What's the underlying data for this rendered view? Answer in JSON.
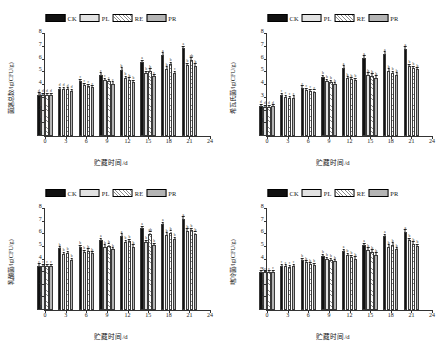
{
  "figure": {
    "legend": [
      {
        "key": "ck",
        "label": "CK",
        "fill": "solid-black",
        "color": "#111111"
      },
      {
        "key": "pl",
        "label": "PL",
        "fill": "dotted-light-gray",
        "color": "#e2e2e2"
      },
      {
        "key": "re",
        "label": "RE",
        "fill": "diagonal-hatch-white",
        "color": "#ffffff"
      },
      {
        "key": "pr",
        "label": "PR",
        "fill": "solid-gray",
        "color": "#b4b4b4"
      }
    ],
    "xlabel": "贮藏时间/d",
    "xticks": [
      "0",
      "3",
      "6",
      "9",
      "12",
      "15",
      "18",
      "21",
      "24"
    ],
    "yticks": [
      "0",
      "1",
      "2",
      "3",
      "4",
      "5",
      "6",
      "7",
      "8"
    ]
  },
  "chart_data": [
    {
      "type": "bar",
      "panel": "top-left",
      "title": "",
      "xlabel": "贮藏时间/d",
      "ylabel": "菌落总数/lg(CFU/g)",
      "categories": [
        "0",
        "3",
        "6",
        "9",
        "12",
        "15",
        "18",
        "21"
      ],
      "xlim": [
        0,
        24
      ],
      "ylim": [
        0,
        8
      ],
      "xticks": [
        "0",
        "3",
        "6",
        "9",
        "12",
        "15",
        "18",
        "21",
        "24"
      ],
      "yticks": [
        "0",
        "1",
        "2",
        "3",
        "4",
        "5",
        "6",
        "7",
        "8"
      ],
      "grid": false,
      "legend_position": "top-center",
      "series": [
        {
          "name": "CK",
          "values": [
            3.25,
            3.7,
            4.3,
            4.8,
            5.2,
            5.78,
            6.35,
            6.88
          ],
          "errors": [
            0.1,
            0.09,
            0.1,
            0.11,
            0.12,
            0.12,
            0.13,
            0.13
          ],
          "labels": [
            "d",
            "d",
            "c",
            "c",
            "b",
            "a",
            "a",
            "a"
          ]
        },
        {
          "name": "PL",
          "values": [
            3.22,
            3.68,
            4.0,
            4.38,
            4.55,
            4.92,
            5.28,
            5.55
          ],
          "errors": [
            0.09,
            0.09,
            0.1,
            0.1,
            0.11,
            0.11,
            0.12,
            0.12
          ],
          "labels": [
            "d",
            "d",
            "c",
            "c",
            "b",
            "b",
            "b",
            "b"
          ]
        },
        {
          "name": "RE",
          "values": [
            3.24,
            3.66,
            3.92,
            4.28,
            4.42,
            5.12,
            5.62,
            5.98
          ],
          "errors": [
            0.09,
            0.09,
            0.09,
            0.1,
            0.1,
            0.11,
            0.12,
            0.12
          ],
          "labels": [
            "d",
            "d",
            "c",
            "c",
            "b",
            "b",
            "b",
            "ab"
          ]
        },
        {
          "name": "PR",
          "values": [
            3.23,
            3.55,
            3.82,
            4.1,
            4.25,
            4.68,
            4.95,
            5.5
          ],
          "errors": [
            0.09,
            0.08,
            0.09,
            0.1,
            0.1,
            0.1,
            0.11,
            0.12
          ],
          "labels": [
            "d",
            "d",
            "c",
            "c",
            "b",
            "c",
            "c",
            "b"
          ]
        }
      ]
    },
    {
      "type": "bar",
      "panel": "top-right",
      "title": "",
      "xlabel": "贮藏时间/d",
      "ylabel": "希瓦氏菌/lg(CFU/g)",
      "categories": [
        "0",
        "3",
        "6",
        "9",
        "12",
        "15",
        "18",
        "21"
      ],
      "xlim": [
        0,
        24
      ],
      "ylim": [
        0,
        8
      ],
      "xticks": [
        "0",
        "3",
        "6",
        "9",
        "12",
        "15",
        "18",
        "21",
        "24"
      ],
      "yticks": [
        "0",
        "1",
        "2",
        "3",
        "4",
        "5",
        "6",
        "7",
        "8"
      ],
      "grid": false,
      "legend_position": "top-center",
      "series": [
        {
          "name": "CK",
          "values": [
            2.35,
            3.22,
            3.8,
            4.62,
            5.35,
            6.12,
            6.45,
            6.82
          ],
          "errors": [
            0.09,
            0.09,
            0.1,
            0.11,
            0.12,
            0.12,
            0.13,
            0.13
          ],
          "labels": [
            "d",
            "c",
            "c",
            "b",
            "a",
            "a",
            "a",
            "a"
          ]
        },
        {
          "name": "PL",
          "values": [
            2.28,
            3.05,
            3.62,
            4.3,
            4.52,
            4.82,
            5.12,
            5.48
          ],
          "errors": [
            0.08,
            0.09,
            0.09,
            0.1,
            0.1,
            0.11,
            0.11,
            0.12
          ],
          "labels": [
            "d",
            "c",
            "c",
            "b",
            "b",
            "b",
            "b",
            "b"
          ]
        },
        {
          "name": "RE",
          "values": [
            2.3,
            3.0,
            3.55,
            4.22,
            4.45,
            4.72,
            4.92,
            5.32
          ],
          "errors": [
            0.08,
            0.09,
            0.09,
            0.1,
            0.1,
            0.11,
            0.11,
            0.12
          ],
          "labels": [
            "d",
            "c",
            "c",
            "b",
            "b",
            "b",
            "b",
            "b"
          ]
        },
        {
          "name": "PR",
          "values": [
            2.32,
            3.02,
            3.48,
            4.05,
            4.38,
            4.58,
            4.82,
            5.22
          ],
          "errors": [
            0.08,
            0.09,
            0.09,
            0.1,
            0.1,
            0.1,
            0.11,
            0.11
          ],
          "labels": [
            "d",
            "c",
            "c",
            "b",
            "b",
            "b",
            "b",
            "b"
          ]
        }
      ]
    },
    {
      "type": "bar",
      "panel": "bottom-left",
      "title": "",
      "xlabel": "贮藏时间/d",
      "ylabel": "乳酸菌/lg(CFU/g)",
      "categories": [
        "0",
        "3",
        "6",
        "9",
        "12",
        "15",
        "18",
        "21"
      ],
      "xlim": [
        0,
        24
      ],
      "ylim": [
        0,
        8
      ],
      "xticks": [
        "0",
        "3",
        "6",
        "9",
        "12",
        "15",
        "18",
        "21",
        "24"
      ],
      "yticks": [
        "0",
        "1",
        "2",
        "3",
        "4",
        "5",
        "6",
        "7",
        "8"
      ],
      "grid": false,
      "legend_position": "top-center",
      "series": [
        {
          "name": "CK",
          "values": [
            3.52,
            4.88,
            5.0,
            5.52,
            5.88,
            6.48,
            6.8,
            7.2
          ],
          "errors": [
            0.09,
            0.11,
            0.11,
            0.12,
            0.12,
            0.13,
            0.13,
            0.14
          ],
          "labels": [
            "c",
            "b",
            "b",
            "a",
            "a",
            "a",
            "a",
            "a"
          ]
        },
        {
          "name": "PL",
          "values": [
            3.5,
            4.42,
            4.58,
            5.02,
            5.38,
            5.38,
            5.98,
            6.28
          ],
          "errors": [
            0.09,
            0.1,
            0.1,
            0.11,
            0.11,
            0.11,
            0.12,
            0.13
          ],
          "labels": [
            "c",
            "b",
            "b",
            "b",
            "b",
            "b",
            "b",
            "b"
          ]
        },
        {
          "name": "RE",
          "values": [
            3.51,
            4.5,
            4.7,
            5.08,
            5.45,
            6.02,
            6.1,
            6.32
          ],
          "errors": [
            0.09,
            0.1,
            0.1,
            0.11,
            0.11,
            0.12,
            0.12,
            0.13
          ],
          "labels": [
            "c",
            "b",
            "b",
            "b",
            "b",
            "ab",
            "b",
            "b"
          ]
        },
        {
          "name": "PR",
          "values": [
            3.5,
            3.98,
            4.48,
            4.8,
            5.02,
            5.12,
            5.62,
            6.02
          ],
          "errors": [
            0.09,
            0.1,
            0.1,
            0.1,
            0.11,
            0.11,
            0.12,
            0.12
          ],
          "labels": [
            "c",
            "b",
            "b",
            "b",
            "b",
            "b",
            "b",
            "b"
          ]
        }
      ]
    },
    {
      "type": "bar",
      "panel": "bottom-right",
      "title": "",
      "xlabel": "贮藏时间/d",
      "ylabel": "嗜冷菌/lg(CFU/g)",
      "categories": [
        "0",
        "3",
        "6",
        "9",
        "12",
        "15",
        "18",
        "21"
      ],
      "xlim": [
        0,
        24
      ],
      "ylim": [
        0,
        8
      ],
      "xticks": [
        "0",
        "3",
        "6",
        "9",
        "12",
        "15",
        "18",
        "21",
        "24"
      ],
      "yticks": [
        "0",
        "1",
        "2",
        "3",
        "4",
        "5",
        "6",
        "7",
        "8"
      ],
      "grid": false,
      "legend_position": "top-center",
      "series": [
        {
          "name": "CK",
          "values": [
            3.02,
            3.5,
            3.95,
            4.28,
            4.65,
            5.12,
            5.85,
            6.2
          ],
          "errors": [
            0.09,
            0.09,
            0.1,
            0.1,
            0.11,
            0.11,
            0.12,
            0.13
          ],
          "labels": [
            "c",
            "c",
            "b",
            "b",
            "a",
            "a",
            "a",
            "a"
          ]
        },
        {
          "name": "PL",
          "values": [
            2.98,
            3.45,
            3.78,
            4.05,
            4.35,
            4.78,
            5.02,
            5.52
          ],
          "errors": [
            0.09,
            0.09,
            0.09,
            0.1,
            0.1,
            0.11,
            0.11,
            0.12
          ],
          "labels": [
            "c",
            "c",
            "b",
            "b",
            "b",
            "b",
            "b",
            "b"
          ]
        },
        {
          "name": "RE",
          "values": [
            3.0,
            3.42,
            3.62,
            3.95,
            4.2,
            4.62,
            5.18,
            5.25
          ],
          "errors": [
            0.09,
            0.09,
            0.09,
            0.1,
            0.1,
            0.1,
            0.11,
            0.12
          ],
          "labels": [
            "c",
            "c",
            "b",
            "b",
            "b",
            "b",
            "b",
            "b"
          ]
        },
        {
          "name": "PR",
          "values": [
            3.01,
            3.48,
            3.58,
            3.85,
            4.08,
            4.38,
            4.8,
            5.05
          ],
          "errors": [
            0.09,
            0.09,
            0.09,
            0.1,
            0.1,
            0.1,
            0.11,
            0.11
          ],
          "labels": [
            "c",
            "c",
            "b",
            "b",
            "b",
            "b",
            "b",
            "b"
          ]
        }
      ]
    }
  ]
}
